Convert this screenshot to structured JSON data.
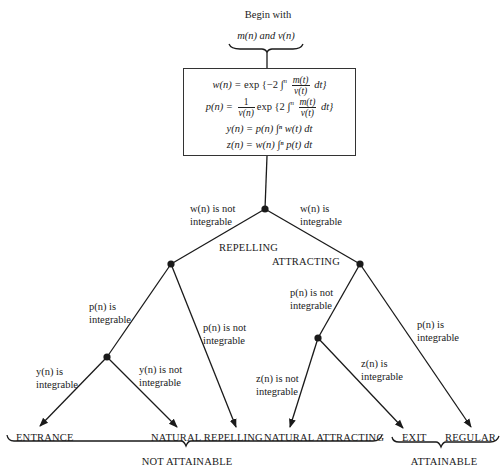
{
  "header": {
    "begin_label": "Begin with",
    "inputs_label": "m(n) and v(n)"
  },
  "formulas": {
    "w_lhs": "w(n) = ",
    "w_rhs_pre": "exp {−2 ∫",
    "w_sup": "n",
    "w_num": "m(t)",
    "w_den": "v(t)",
    "w_post": "dt}",
    "p_lhs": "p(n) = ",
    "p_num": "1",
    "p_den": "v(n)",
    "p_rhs_pre": "exp {2 ∫",
    "p_sup": "n",
    "p_num2": "m(t)",
    "p_den2": "v(t)",
    "p_post": "dt}",
    "y_line": "y(n) = p(n) ∫ⁿ w(t) dt",
    "z_line": "z(n) = w(n) ∫ⁿ p(t) dt"
  },
  "branches": {
    "w_not_integrable": [
      "w(n) is not",
      "integrable"
    ],
    "w_integrable": [
      "w(n) is",
      "integrable"
    ],
    "repelling": "REPELLING",
    "attracting": "ATTRACTING",
    "p_integrable_left": [
      "p(n) is",
      "integrable"
    ],
    "p_not_integrable_left": [
      "p(n) is not",
      "integrable"
    ],
    "p_not_integrable_right": [
      "p(n) is not",
      "integrable"
    ],
    "p_integrable_right": [
      "p(n) is",
      "integrable"
    ],
    "y_integrable": [
      "y(n) is",
      "integrable"
    ],
    "y_not_integrable": [
      "y(n) is not",
      "integrable"
    ],
    "z_not_integrable": [
      "z(n) is not",
      "integrable"
    ],
    "z_integrable": [
      "z(n) is",
      "integrable"
    ]
  },
  "outcomes": {
    "entrance": "ENTRANCE",
    "natural_repelling": "NATURAL REPELLING",
    "natural_attracting": "NATURAL ATTRACTING",
    "exit": "EXIT",
    "regular": "REGULAR"
  },
  "groups": {
    "not_attainable": "NOT ATTAINABLE",
    "attainable": "ATTAINABLE"
  },
  "colors": {
    "ink": "#1a1a1a",
    "background": "#ffffff"
  }
}
